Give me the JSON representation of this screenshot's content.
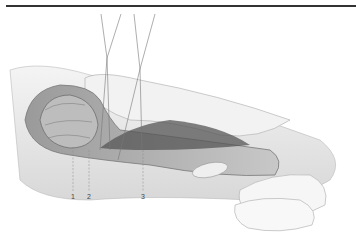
{
  "figure": {
    "type": "anatomical illustration",
    "labels": [
      {
        "id": "1",
        "text": "1"
      },
      {
        "id": "2",
        "text": "2"
      },
      {
        "id": "3",
        "text": "3"
      }
    ]
  },
  "colors": {
    "rule": "#333333",
    "tissue": "#b8b8b8",
    "dark": "#555555",
    "light": "#f0f0f0"
  }
}
